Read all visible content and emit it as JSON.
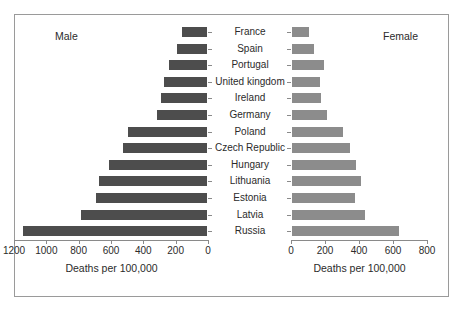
{
  "chart_data": {
    "type": "bar",
    "orientation": "horizontal",
    "layout": "back-to-back pyramid",
    "title": "",
    "categories": [
      "France",
      "Spain",
      "Portugal",
      "United kingdom",
      "Ireland",
      "Germany",
      "Poland",
      "Czech Republic",
      "Hungary",
      "Lithuania",
      "Estonia",
      "Latvia",
      "Russia"
    ],
    "series": [
      {
        "name": "Male",
        "side": "left",
        "color": "#4d4d4d",
        "xlabel": "Deaths per 100,000",
        "ticks": [
          1200,
          1000,
          800,
          600,
          400,
          200,
          0
        ],
        "xlim": [
          1200,
          0
        ],
        "values": [
          170,
          195,
          250,
          280,
          300,
          320,
          500,
          530,
          620,
          680,
          700,
          790,
          1150
        ]
      },
      {
        "name": "Female",
        "side": "right",
        "color": "#8c8c8c",
        "xlabel": "Deaths per 100,000",
        "ticks": [
          0,
          200,
          400,
          600,
          800
        ],
        "xlim": [
          0,
          800
        ],
        "values": [
          110,
          140,
          200,
          175,
          185,
          215,
          310,
          355,
          390,
          415,
          385,
          440,
          640
        ]
      }
    ],
    "grid": false,
    "legend_position": "inline-top-corners"
  },
  "labels": {
    "male_series": "Male",
    "female_series": "Female",
    "male_axis_title": "Deaths per 100,000",
    "female_axis_title": "Deaths per 100,000"
  },
  "colors": {
    "male_bar": "#4d4d4d",
    "female_bar": "#8c8c8c",
    "frame": "#9a9a9a",
    "axis": "#8a8a8a",
    "text": "#2b2b2b",
    "background": "#ffffff"
  }
}
